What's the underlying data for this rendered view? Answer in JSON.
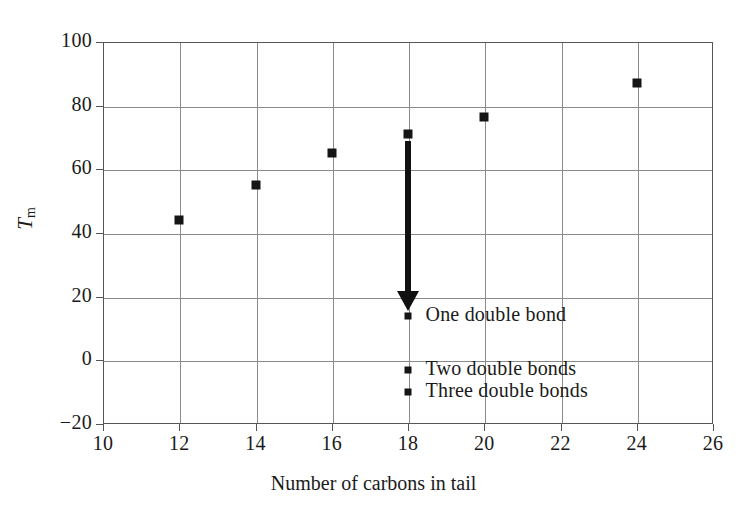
{
  "chart_data": {
    "type": "scatter",
    "title": "",
    "xlabel": "Number of carbons in tail",
    "ylabel": "T_m",
    "ylabel_text": "T",
    "ylabel_sub": "m",
    "xlim": [
      10,
      26
    ],
    "ylim": [
      -20,
      100
    ],
    "xticks": [
      10,
      12,
      14,
      16,
      18,
      20,
      22,
      24,
      26
    ],
    "xtick_labels": [
      "10",
      "12",
      "14",
      "16",
      "18",
      "20",
      "22",
      "24",
      "26"
    ],
    "yticks": [
      -20,
      0,
      20,
      40,
      60,
      80,
      100
    ],
    "ytick_labels": [
      "−20",
      "0",
      "20",
      "40",
      "60",
      "80",
      "100"
    ],
    "grid": true,
    "legend_position": "inline-annotations",
    "series": [
      {
        "name": "Saturated",
        "marker": "square",
        "color": "#151515",
        "points": [
          {
            "x": 12,
            "y": 44
          },
          {
            "x": 14,
            "y": 55
          },
          {
            "x": 16,
            "y": 65
          },
          {
            "x": 18,
            "y": 71
          },
          {
            "x": 20,
            "y": 76.5
          },
          {
            "x": 24,
            "y": 87
          }
        ]
      },
      {
        "name": "One double bond",
        "marker": "square",
        "color": "#151515",
        "points": [
          {
            "x": 18,
            "y": 14
          }
        ]
      },
      {
        "name": "Two double bonds",
        "marker": "square",
        "color": "#151515",
        "points": [
          {
            "x": 18,
            "y": -3
          }
        ]
      },
      {
        "name": "Three double bonds",
        "marker": "square",
        "color": "#151515",
        "points": [
          {
            "x": 18,
            "y": -10
          }
        ]
      }
    ],
    "annotations": [
      {
        "type": "arrow",
        "x": 18,
        "y_from": 69,
        "y_to": 16,
        "color": "#111111"
      },
      {
        "type": "text",
        "label": "One double bond",
        "x": 18.25,
        "y": 14
      },
      {
        "type": "text",
        "label": "Two double bonds",
        "x": 18.25,
        "y": -3
      },
      {
        "type": "text",
        "label": "Three double bonds",
        "x": 18.25,
        "y": -10
      }
    ]
  },
  "axes": {
    "x_title": "Number of carbons in tail",
    "y_title_main": "T",
    "y_title_sub": "m"
  },
  "colors": {
    "marker": "#151515",
    "grid": "#8a8a8a",
    "frame": "#555555",
    "arrow": "#111111",
    "background": "#ffffff"
  }
}
